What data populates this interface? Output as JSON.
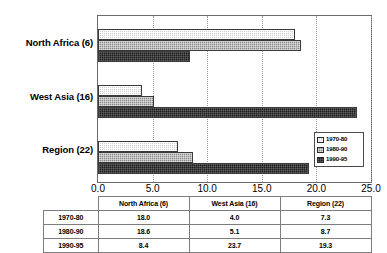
{
  "chart_data": {
    "type": "bar",
    "orientation": "horizontal",
    "title": "",
    "xlabel": "",
    "ylabel": "",
    "xlim": [
      0.0,
      25.0
    ],
    "xticks": [
      "0.0",
      "5.0",
      "10.0",
      "15.0",
      "20.0",
      "25.0"
    ],
    "xtick_values": [
      0,
      5,
      10,
      15,
      20,
      25
    ],
    "grid": true,
    "grid_axis": "x",
    "legend_position": "lower right",
    "categories": [
      "North Africa (6)",
      "West Asia (16)",
      "Region (22)"
    ],
    "series": [
      {
        "name": "1970-80",
        "values": [
          18.0,
          4.0,
          7.3
        ],
        "color": "#d2d2d2"
      },
      {
        "name": "1980-90",
        "values": [
          18.6,
          5.1,
          8.7
        ],
        "color": "#8a8a8a"
      },
      {
        "name": "1990-95",
        "values": [
          8.4,
          23.7,
          19.3
        ],
        "color": "#1c1c1c"
      }
    ]
  },
  "legend": {
    "items": [
      {
        "label": "1970-80"
      },
      {
        "label": "1980-90"
      },
      {
        "label": "1990-95"
      }
    ]
  },
  "table": {
    "corner_label": "",
    "columns": [
      "North Africa (6)",
      "West Asia (16)",
      "Region (22)"
    ],
    "rows": [
      {
        "label": "1970-80",
        "cells": [
          "18.0",
          "4.0",
          "7.3"
        ]
      },
      {
        "label": "1980-90",
        "cells": [
          "18.6",
          "5.1",
          "8.7"
        ]
      },
      {
        "label": "1990-95",
        "cells": [
          "8.4",
          "23.7",
          "19.3"
        ]
      }
    ]
  }
}
